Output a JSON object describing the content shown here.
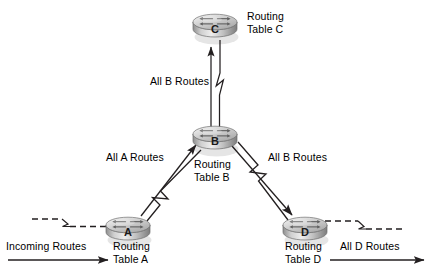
{
  "diagram": {
    "background_color": "#ffffff",
    "line_color": "#231f20",
    "text_color": "#000000",
    "router_body_color": "#b5b5b5",
    "router_top_color": "#d9d9d9",
    "routers": [
      {
        "id": "C",
        "letter": "C",
        "label_line1": "Routing",
        "label_line2": "Table C",
        "x": 215,
        "y": 25,
        "label_x": 247,
        "label_y": 10
      },
      {
        "id": "B",
        "letter": "B",
        "label_line1": "Routing",
        "label_line2": "Table B",
        "x": 215,
        "y": 137,
        "label_x": 194,
        "label_y": 158
      },
      {
        "id": "A",
        "letter": "A",
        "label_line1": "Routing",
        "label_line2": "Table A",
        "x": 128,
        "y": 228,
        "label_x": 107,
        "label_y": 240
      },
      {
        "id": "D",
        "letter": "D",
        "label_line1": "Routing",
        "label_line2": "Table D",
        "x": 305,
        "y": 228,
        "label_x": 285,
        "label_y": 240
      }
    ],
    "links": [
      {
        "id": "b-to-c",
        "label": "All B Routes",
        "from": "B",
        "to": "C",
        "style": "double-line-with-break",
        "label_x": 150,
        "label_y": 75
      },
      {
        "id": "a-to-b",
        "label": "All A Routes",
        "from": "A",
        "to": "B",
        "style": "double-line-with-break",
        "label_x": 106,
        "label_y": 151
      },
      {
        "id": "b-to-d",
        "label": "All B Routes",
        "from": "B",
        "to": "D",
        "style": "double-line-with-break",
        "label_x": 268,
        "label_y": 151
      }
    ],
    "flows": [
      {
        "id": "incoming-routes",
        "label": "Incoming Routes",
        "style": "solid-arrow",
        "label_x": 6,
        "label_y": 240
      },
      {
        "id": "all-d-routes",
        "label": "All D Routes",
        "style": "solid-arrow",
        "label_x": 340,
        "label_y": 240
      }
    ]
  }
}
